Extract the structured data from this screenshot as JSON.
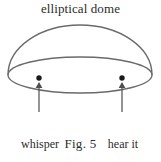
{
  "figure": {
    "title": "elliptical dome",
    "caption": "Fig. 5",
    "labels": {
      "left": {
        "line1": "whisper",
        "line2": "here"
      },
      "right": {
        "line1": "hear it",
        "line2": "here"
      }
    },
    "colors": {
      "background": "#ffffff",
      "stroke": "#6a6a6a",
      "stroke_dark": "#4e4e4e",
      "text": "#2b2b2b",
      "dot": "#1a1a1a"
    },
    "geometry": {
      "base_ellipse": {
        "cx": 80,
        "cy": 75,
        "rx": 72,
        "ry": 18
      },
      "dome_arc": {
        "start_x": 8,
        "start_y": 75,
        "apex_x": 80,
        "apex_y": 25,
        "end_x": 152,
        "end_y": 75
      },
      "focus_left": {
        "x": 39,
        "y": 78,
        "r": 2.6
      },
      "focus_right": {
        "x": 122,
        "y": 78,
        "r": 2.6
      },
      "arrow_left": {
        "x": 39,
        "y_tail": 112,
        "y_head": 83
      },
      "arrow_right": {
        "x": 122,
        "y_tail": 112,
        "y_head": 83
      }
    }
  }
}
